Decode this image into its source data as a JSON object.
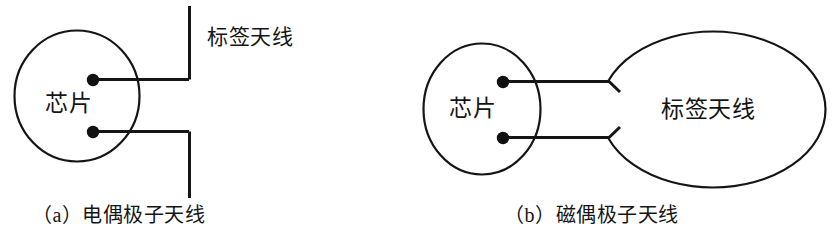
{
  "figure": {
    "title_text_left_chip": "芯片",
    "left_panel": {
      "chip_label": "芯片",
      "antenna_label": "标签天线",
      "caption": "（a）电偶极子天线",
      "caption_prefix": "（a）",
      "caption_name": "电偶极子天线"
    },
    "right_panel": {
      "chip_label": "芯片",
      "antenna_label": "标签天线",
      "caption": "（b）磁偶极子天线",
      "caption_prefix": "（b）",
      "caption_name": "磁偶极子天线"
    },
    "colors": {
      "stroke": "#151515",
      "background": "#ffffff",
      "terminal_dot": "#111111"
    },
    "geometry": {
      "left_chip_circle": {
        "cx": 77,
        "cy": 96,
        "rx": 62,
        "ry": 65
      },
      "left_dipole_arm_x": 189,
      "left_upper_terminal": {
        "x": 93,
        "y": 80
      },
      "left_lower_terminal": {
        "x": 93,
        "y": 132
      },
      "right_chip_circle": {
        "cx": 482,
        "cy": 109,
        "rx": 58,
        "ry": 65
      },
      "right_loop_ellipse": {
        "cx": 713,
        "cy": 109,
        "rx": 113,
        "ry": 78
      },
      "right_upper_terminal": {
        "x": 503,
        "y": 82
      },
      "right_lower_terminal": {
        "x": 503,
        "y": 138
      }
    }
  }
}
